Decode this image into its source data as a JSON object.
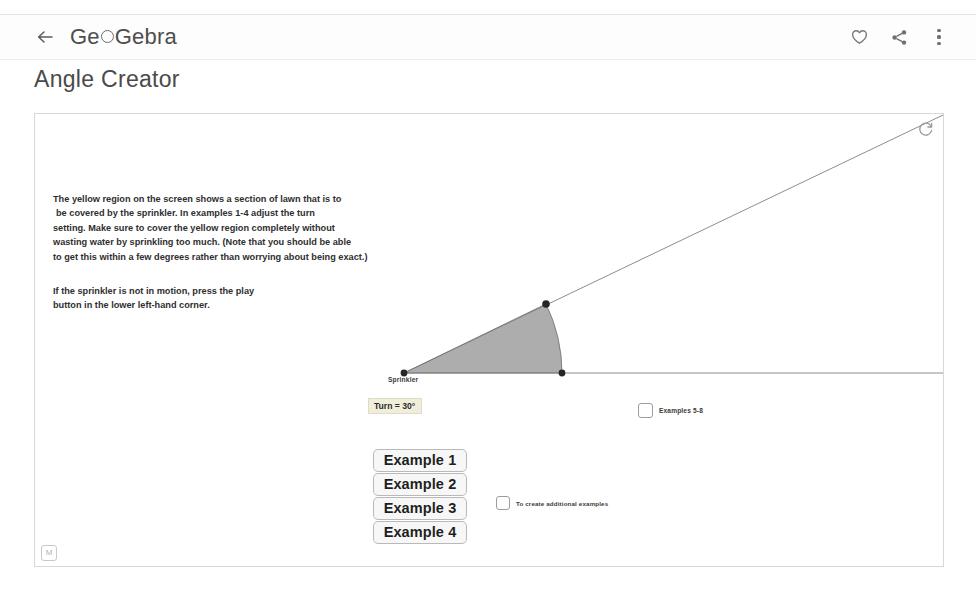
{
  "appbar": {
    "back_icon": "back-arrow-icon",
    "brand_part1": "Ge",
    "brand_part2": "Gebra",
    "favorite_icon": "heart-icon",
    "share_icon": "share-icon",
    "menu_icon": "kebab-menu-icon"
  },
  "page": {
    "title": "Angle Creator"
  },
  "applet": {
    "refresh_icon": "refresh-icon",
    "logo_label": "M",
    "instructions": {
      "paragraph1_line1": "The yellow region on the screen shows a section of lawn that is to",
      "paragraph1_line2": "be covered by the sprinkler. In examples 1-4 adjust the turn",
      "paragraph1_line3": "setting. Make sure to cover the yellow region completely without",
      "paragraph1_line4": "wasting water by sprinkling too much. (Note that you should be able",
      "paragraph1_line5": "to get this within a few degrees rather than worrying about being exact.)",
      "paragraph2_line1": "If the sprinkler is not in motion, press the play",
      "paragraph2_line2": "button in the lower left-hand corner."
    },
    "geometry": {
      "vertex_label": "Sprinkler",
      "turn_label": "Turn = 30°",
      "turn_value": 30,
      "turn_unit": "°",
      "sector_fill": "#8a8a8a",
      "ray_color": "#7a7a7a",
      "point_color": "#2b2b2b"
    },
    "example_buttons": [
      {
        "label": "Example 1"
      },
      {
        "label": "Example 2"
      },
      {
        "label": "Example 3"
      },
      {
        "label": "Example 4"
      }
    ],
    "checkboxes": [
      {
        "label": "Examples 5-8",
        "checked": false
      },
      {
        "label": "To create additional examples",
        "checked": false
      }
    ]
  }
}
